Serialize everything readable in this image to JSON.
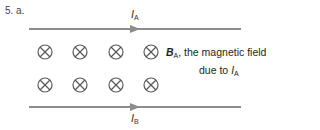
{
  "question": {
    "number_label": "5. a."
  },
  "currents": {
    "top": {
      "symbol": "I",
      "subscript": "A",
      "direction": "right"
    },
    "bottom": {
      "symbol": "I",
      "subscript": "B",
      "direction": "right"
    }
  },
  "field": {
    "symbol": "B",
    "subscript": "A",
    "text_line1": ", the magnetic field",
    "text_line2_prefix": "due to ",
    "text_line2_symbol": "I",
    "text_line2_subscript": "A",
    "marker": "into-page (⊗)",
    "rows": 2,
    "columns": 4
  },
  "colors": {
    "wire": "#8c8c8c",
    "marker": "#5a5a5a",
    "text": "#231f20"
  }
}
